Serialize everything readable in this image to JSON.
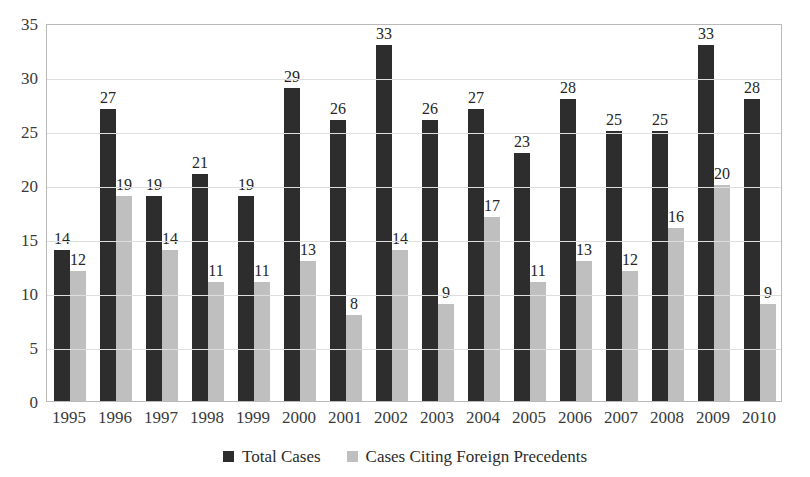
{
  "chart_data": {
    "type": "bar",
    "title": "",
    "subtitle": "",
    "xlabel": "",
    "ylabel": "",
    "categories": [
      "1995",
      "1996",
      "1997",
      "1998",
      "1999",
      "2000",
      "2001",
      "2002",
      "2003",
      "2004",
      "2005",
      "2006",
      "2007",
      "2008",
      "2009",
      "2010"
    ],
    "series": [
      {
        "name": "Total Cases",
        "color": "#2d2d2d",
        "values": [
          14,
          27,
          19,
          21,
          19,
          29,
          26,
          33,
          26,
          27,
          23,
          28,
          25,
          25,
          33,
          28
        ]
      },
      {
        "name": "Cases Citing Foreign Precedents",
        "color": "#bfbfbf",
        "values": [
          12,
          19,
          14,
          11,
          11,
          13,
          8,
          14,
          9,
          17,
          11,
          13,
          12,
          16,
          20,
          9
        ]
      }
    ],
    "ylim": [
      0,
      35
    ],
    "yticks": [
      0,
      5,
      10,
      15,
      20,
      25,
      30,
      35
    ],
    "ytick_labels": [
      "0",
      "5",
      "10",
      "15",
      "20",
      "25",
      "30",
      "35"
    ],
    "grid": true,
    "grid_axis": "y",
    "legend_position": "bottom",
    "data_labels": true
  }
}
